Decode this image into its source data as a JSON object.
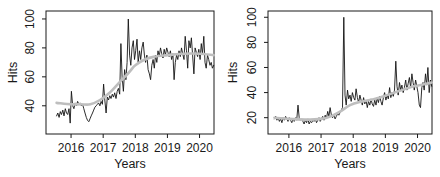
{
  "figure": {
    "background": "#ffffff",
    "axis_color": "#1a1a1a",
    "series_color": "#141414",
    "smooth_color": "#bebebe"
  },
  "chart_data": [
    {
      "type": "line",
      "title": "",
      "xlabel": "Years",
      "ylabel": "Hits",
      "x_ticks": [
        2016,
        2017,
        2018,
        2019,
        2020
      ],
      "y_ticks": [
        40,
        60,
        80,
        100
      ],
      "xlim": [
        2015.22,
        2020.45
      ],
      "ylim": [
        20.5,
        105.5
      ],
      "grid": false,
      "legend": "none",
      "series": [
        {
          "name": "weekly-hits",
          "color": "#141414",
          "x_start": 2015.55,
          "x_step": 0.0385,
          "values": [
            33,
            35,
            32,
            36,
            34,
            37,
            33,
            38,
            35,
            34,
            38,
            28,
            50,
            40,
            38,
            42,
            40,
            43,
            41,
            42,
            40,
            41,
            38,
            35,
            32,
            30,
            29,
            31,
            33,
            35,
            37,
            39,
            40,
            41,
            42,
            40,
            43,
            41,
            55,
            44,
            35,
            46,
            44,
            47,
            45,
            48,
            46,
            49,
            45,
            50,
            52,
            48,
            83,
            60,
            50,
            65,
            58,
            70,
            100,
            75,
            68,
            80,
            85,
            72,
            78,
            86,
            70,
            78,
            72,
            80,
            84,
            75,
            70,
            75,
            65,
            62,
            58,
            68,
            72,
            66,
            75,
            70,
            78,
            74,
            80,
            76,
            73,
            79,
            75,
            80,
            77,
            74,
            78,
            72,
            76,
            58,
            70,
            75,
            72,
            78,
            74,
            80,
            76,
            72,
            88,
            78,
            66,
            85,
            80,
            87,
            75,
            62,
            80,
            77,
            74,
            79,
            72,
            83,
            76,
            88,
            70,
            66,
            75,
            72,
            68,
            70,
            66,
            68
          ]
        },
        {
          "name": "smooth-trend",
          "color": "#bebebe",
          "points": [
            [
              2015.55,
              42
            ],
            [
              2016.0,
              41
            ],
            [
              2016.3,
              41
            ],
            [
              2016.6,
              41
            ],
            [
              2016.9,
              44
            ],
            [
              2017.2,
              49
            ],
            [
              2017.5,
              56
            ],
            [
              2017.8,
              63
            ],
            [
              2018.0,
              68
            ],
            [
              2018.3,
              72
            ],
            [
              2018.6,
              74
            ],
            [
              2019.0,
              75
            ],
            [
              2019.5,
              76
            ],
            [
              2020.0,
              76
            ],
            [
              2020.44,
              75
            ]
          ]
        }
      ]
    },
    {
      "type": "line",
      "title": "",
      "xlabel": "Years",
      "ylabel": "Hits",
      "x_ticks": [
        2016,
        2017,
        2018,
        2019,
        2020
      ],
      "y_ticks": [
        20,
        40,
        60,
        80,
        100
      ],
      "xlim": [
        2015.35,
        2020.45
      ],
      "ylim": [
        7,
        105
      ],
      "grid": false,
      "legend": "none",
      "series": [
        {
          "name": "weekly-hits",
          "color": "#141414",
          "x_start": 2015.55,
          "x_step": 0.0385,
          "values": [
            19,
            21,
            18,
            20,
            17,
            19,
            16,
            20,
            18,
            21,
            19,
            17,
            20,
            18,
            16,
            19,
            17,
            20,
            18,
            30,
            20,
            18,
            19,
            17,
            15,
            18,
            16,
            19,
            15,
            17,
            16,
            18,
            17,
            19,
            16,
            18,
            20,
            17,
            19,
            21,
            18,
            22,
            19,
            25,
            21,
            28,
            22,
            20,
            22,
            19,
            21,
            23,
            22,
            24,
            26,
            28,
            100,
            38,
            30,
            42,
            35,
            38,
            33,
            40,
            36,
            34,
            43,
            36,
            32,
            38,
            34,
            30,
            36,
            31,
            34,
            28,
            33,
            30,
            35,
            31,
            29,
            34,
            30,
            36,
            32,
            37,
            33,
            30,
            36,
            40,
            34,
            38,
            35,
            44,
            36,
            40,
            37,
            42,
            65,
            45,
            38,
            48,
            42,
            46,
            40,
            44,
            50,
            42,
            47,
            52,
            44,
            55,
            48,
            42,
            50,
            45,
            40,
            30,
            28,
            44,
            48,
            42,
            55,
            46,
            60,
            40,
            50,
            45
          ]
        },
        {
          "name": "smooth-trend",
          "color": "#bebebe",
          "points": [
            [
              2015.55,
              20
            ],
            [
              2016.0,
              19
            ],
            [
              2016.5,
              18.5
            ],
            [
              2017.0,
              19
            ],
            [
              2017.3,
              21
            ],
            [
              2017.6,
              25
            ],
            [
              2017.9,
              30
            ],
            [
              2018.2,
              32.5
            ],
            [
              2018.6,
              34.5
            ],
            [
              2019.0,
              37.5
            ],
            [
              2019.4,
              41
            ],
            [
              2019.8,
              44.5
            ],
            [
              2020.1,
              46
            ],
            [
              2020.44,
              48
            ]
          ]
        }
      ]
    }
  ]
}
